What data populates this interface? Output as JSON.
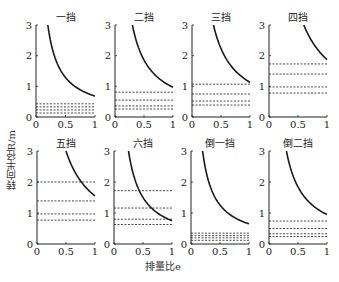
{
  "figure": {
    "ylabel": "转向半径R/m",
    "xlabel": "排量比e"
  },
  "chart_data": [
    {
      "type": "line",
      "title": "一挡",
      "xlim": [
        0,
        1
      ],
      "ylim": [
        0,
        3
      ],
      "xticks": [
        "0",
        "0.5",
        "1"
      ],
      "yticks": [
        "0",
        "1",
        "2",
        "3"
      ],
      "curve": {
        "x_start": 0.2,
        "y_end": 0.68
      },
      "dashed_levels": [
        0.43,
        0.33,
        0.23,
        0.13
      ]
    },
    {
      "type": "line",
      "title": "二挡",
      "xlim": [
        0,
        1
      ],
      "ylim": [
        0,
        3
      ],
      "xticks": [
        "0",
        "0.5",
        "1"
      ],
      "yticks": [
        "0",
        "1",
        "2",
        "3"
      ],
      "curve": {
        "x_start": 0.3,
        "y_end": 0.97
      },
      "dashed_levels": [
        0.81,
        0.55,
        0.36,
        0.26
      ]
    },
    {
      "type": "line",
      "title": "三挡",
      "xlim": [
        0,
        1
      ],
      "ylim": [
        0,
        3
      ],
      "xticks": [
        "0",
        "0.5",
        "1"
      ],
      "yticks": [
        "0",
        "1",
        "2",
        "3"
      ],
      "curve": {
        "x_start": 0.37,
        "y_end": 1.13
      },
      "dashed_levels": [
        1.07,
        0.75,
        0.52,
        0.39
      ]
    },
    {
      "type": "line",
      "title": "四挡",
      "xlim": [
        0,
        1
      ],
      "ylim": [
        0,
        3
      ],
      "xticks": [
        "0",
        "0.5",
        "1"
      ],
      "yticks": [
        "0",
        "1",
        "2",
        "3"
      ],
      "curve": {
        "x_start": 0.6,
        "y_end": 1.87
      },
      "dashed_levels": [
        1.73,
        1.4,
        0.98,
        0.78
      ]
    },
    {
      "type": "line",
      "title": "五挡",
      "xlim": [
        0,
        1
      ],
      "ylim": [
        0,
        3
      ],
      "xticks": [
        "0",
        "0.5",
        "1"
      ],
      "yticks": [
        "0",
        "1",
        "2",
        "3"
      ],
      "curve": {
        "x_start": 0.5,
        "y_end": 1.55
      },
      "dashed_levels": [
        2.0,
        1.39,
        0.97,
        0.77
      ]
    },
    {
      "type": "line",
      "title": "六挡",
      "xlim": [
        0,
        1
      ],
      "ylim": [
        0,
        3
      ],
      "xticks": [
        "0",
        "0.5",
        "1"
      ],
      "yticks": [
        "0",
        "1",
        "2",
        "3"
      ],
      "curve": {
        "x_start": 0.25,
        "y_end": 0.75
      },
      "dashed_levels": [
        1.72,
        1.16,
        0.8,
        0.63
      ]
    },
    {
      "type": "line",
      "title": "倒一挡",
      "xlim": [
        0,
        1
      ],
      "ylim": [
        0,
        3
      ],
      "xticks": [
        "0",
        "0.5",
        "1"
      ],
      "yticks": [
        "0",
        "1",
        "2",
        "3"
      ],
      "curve": {
        "x_start": 0.2,
        "y_end": 0.65
      },
      "dashed_levels": [
        0.35,
        0.27,
        0.2,
        0.12
      ]
    },
    {
      "type": "line",
      "title": "倒二挡",
      "xlim": [
        0,
        1
      ],
      "ylim": [
        0,
        3
      ],
      "xticks": [
        "0",
        "0.5",
        "1"
      ],
      "yticks": [
        "0",
        "1",
        "2",
        "3"
      ],
      "curve": {
        "x_start": 0.3,
        "y_end": 0.95
      },
      "dashed_levels": [
        0.74,
        0.5,
        0.33,
        0.24
      ]
    }
  ],
  "layout": {
    "panels": [
      {
        "left": 36,
        "top": 25,
        "width": 59,
        "height": 92
      },
      {
        "left": 115,
        "top": 25,
        "width": 58,
        "height": 92
      },
      {
        "left": 192,
        "top": 25,
        "width": 58,
        "height": 92
      },
      {
        "left": 269,
        "top": 25,
        "width": 58,
        "height": 92
      },
      {
        "left": 37,
        "top": 151,
        "width": 58,
        "height": 93
      },
      {
        "left": 114,
        "top": 151,
        "width": 58,
        "height": 93
      },
      {
        "left": 191,
        "top": 151,
        "width": 58,
        "height": 93
      },
      {
        "left": 269,
        "top": 151,
        "width": 58,
        "height": 93
      }
    ],
    "curve_color": "#1a1a1a",
    "dash_color": "#333333"
  }
}
